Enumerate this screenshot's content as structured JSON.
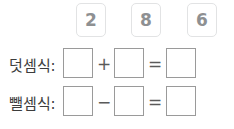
{
  "worksheet": {
    "number_tiles": [
      {
        "value": "2",
        "name": "number-tile-2"
      },
      {
        "value": "8",
        "name": "number-tile-8"
      },
      {
        "value": "6",
        "name": "number-tile-6"
      }
    ],
    "rows": [
      {
        "label": "덧셈식:",
        "operator": "+",
        "equals": "=",
        "box_values": [
          "",
          "",
          ""
        ]
      },
      {
        "label": "뺄셈식:",
        "operator": "−",
        "equals": "=",
        "box_values": [
          "",
          "",
          ""
        ]
      }
    ]
  },
  "colors": {
    "tile_border": "#e2e3e4",
    "tile_text": "#8e9092",
    "box_border": "#9a9a9a",
    "label_text": "#3c3c3c",
    "operator_text": "#5a5a5a",
    "background": "#ffffff"
  }
}
